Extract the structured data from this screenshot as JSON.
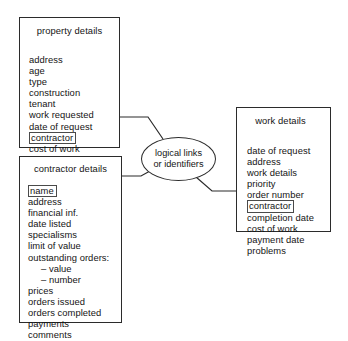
{
  "diagram": {
    "title": "logical links or identifiers",
    "link_node": {
      "line1": "logical links",
      "line2": "or identifiers"
    },
    "entities": [
      {
        "id": "property-details",
        "title": "property details",
        "fields": [
          {
            "label": "address",
            "key": false
          },
          {
            "label": "age",
            "key": false
          },
          {
            "label": "type",
            "key": false
          },
          {
            "label": "construction",
            "key": false
          },
          {
            "label": "tenant",
            "key": false
          },
          {
            "label": "work requested",
            "key": false
          },
          {
            "label": "date of request",
            "key": false
          },
          {
            "label": "contractor",
            "key": true
          },
          {
            "label": "cost of work",
            "key": false
          },
          {
            "label": "completion date",
            "key": false
          }
        ]
      },
      {
        "id": "contractor-details",
        "title": "contractor details",
        "fields": [
          {
            "label": "name",
            "key": true
          },
          {
            "label": "address",
            "key": false
          },
          {
            "label": "financial inf.",
            "key": false
          },
          {
            "label": "date listed",
            "key": false
          },
          {
            "label": "specialisms",
            "key": false
          },
          {
            "label": "limit of value",
            "key": false
          },
          {
            "label": "outstanding orders:",
            "key": false
          },
          {
            "label": "– value",
            "key": false,
            "sub": true
          },
          {
            "label": "– number",
            "key": false,
            "sub": true
          },
          {
            "label": "prices",
            "key": false
          },
          {
            "label": "orders issued",
            "key": false
          },
          {
            "label": "orders completed",
            "key": false
          },
          {
            "label": "payments",
            "key": false
          },
          {
            "label": "comments",
            "key": false,
            "gap_before": true
          }
        ]
      },
      {
        "id": "work-details",
        "title": "work details",
        "fields": [
          {
            "label": "date of request",
            "key": false
          },
          {
            "label": "address",
            "key": false
          },
          {
            "label": "work details",
            "key": false
          },
          {
            "label": "priority",
            "key": false
          },
          {
            "label": "order number",
            "key": false
          },
          {
            "label": "contractor",
            "key": true
          },
          {
            "label": "completion date",
            "key": false
          },
          {
            "label": "cost of work",
            "key": false
          },
          {
            "label": "payment date",
            "key": false
          },
          {
            "label": "problems",
            "key": false
          }
        ]
      }
    ],
    "connections": [
      {
        "from": "property-details.contractor",
        "to": "link-node"
      },
      {
        "from": "contractor-details.name",
        "to": "link-node"
      },
      {
        "from": "link-node",
        "to": "work-details.contractor"
      }
    ],
    "colors": {
      "stroke": "#2b2b2b",
      "text": "#141414",
      "background": "#ffffff"
    }
  }
}
